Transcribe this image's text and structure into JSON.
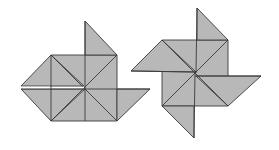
{
  "figure": {
    "colors": {
      "fill": "#b8b8b8",
      "stroke": "#3a3a3a",
      "background": "#ffffff"
    },
    "figures": [
      {
        "id": "left-figure",
        "square": {
          "x": 51,
          "y": 55,
          "size": 66
        },
        "center": [
          85,
          88
        ],
        "flaps": [
          "top",
          "left-upper",
          "left-lower",
          "right"
        ]
      },
      {
        "id": "right-figure",
        "square": {
          "x": 162,
          "y": 40,
          "size": 66
        },
        "center": [
          196,
          73
        ],
        "flaps": [
          "top",
          "left",
          "right",
          "bottom"
        ]
      }
    ]
  }
}
